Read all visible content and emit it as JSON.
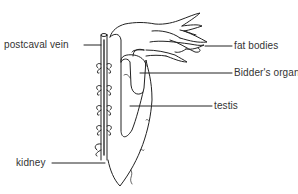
{
  "figure": {
    "type": "anatomical line drawing",
    "line_color": "#222222",
    "background": "#ffffff"
  },
  "labels": [
    {
      "id": "postcaval-vein",
      "text": "postcaval vein"
    },
    {
      "id": "fat-bodies",
      "text": "fat bodies"
    },
    {
      "id": "bidders-organ",
      "text": "Bidder's organ"
    },
    {
      "id": "testis",
      "text": "testis"
    },
    {
      "id": "kidney",
      "text": "kidney"
    }
  ]
}
